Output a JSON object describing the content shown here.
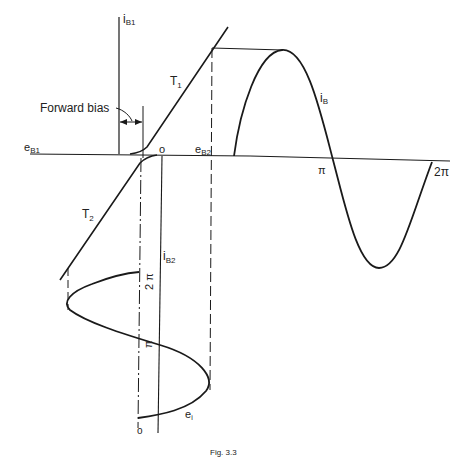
{
  "diagram": {
    "type": "transistor class-B transfer characteristic construction",
    "labels": {
      "i_b1": "i",
      "i_b1_sub": "B1",
      "t1": "T",
      "t1_sub": "1",
      "t2": "T",
      "t2_sub": "2",
      "forward_bias": "Forward bias",
      "e_b1": "e",
      "e_b1_sub": "B1",
      "e_b2": "e",
      "e_b2_sub": "B2",
      "origin_top": "o",
      "i_b": "i",
      "i_b_sub": "B",
      "pi_h": "π",
      "two_pi_h": "2π",
      "i_b2": "i",
      "i_b2_sub": "B2",
      "two_pi_v": "2 π",
      "pi_v": "π",
      "origin_bottom": "o",
      "e_i": "e",
      "e_i_sub": "i"
    },
    "caption": "Fig. 3.3",
    "colors": {
      "ink": "#1a1a1a",
      "background": "#ffffff"
    }
  }
}
